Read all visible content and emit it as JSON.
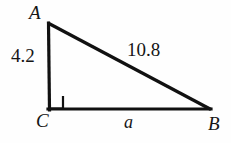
{
  "figure": {
    "kind": "right-triangle-geometry-diagram",
    "background_color": "#fefefe",
    "stroke_color": "#111111",
    "stroke_width": 3,
    "vertices": {
      "A": {
        "label": "A",
        "x": 48,
        "y": 23
      },
      "C": {
        "label": "C",
        "x": 49,
        "y": 110
      },
      "B": {
        "label": "B",
        "x": 210,
        "y": 110
      }
    },
    "right_angle": {
      "at_vertex": "C",
      "marker": "square",
      "size": 13
    },
    "sides": {
      "leg_vertical": {
        "from": "A",
        "to": "C",
        "label": "4.2",
        "label_kind": "measure"
      },
      "hypotenuse": {
        "from": "A",
        "to": "B",
        "label": "10.8",
        "label_kind": "measure"
      },
      "leg_base": {
        "from": "C",
        "to": "B",
        "label": "a",
        "label_kind": "variable"
      }
    }
  }
}
